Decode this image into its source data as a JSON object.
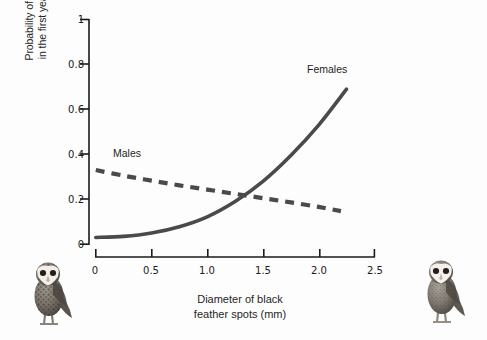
{
  "chart_data": {
    "type": "line",
    "title": "",
    "xlabel": "Diameter of black feather spots (mm)",
    "ylabel": "Probability of survival in the first year of life",
    "xlim": [
      0,
      2.5
    ],
    "ylim": [
      0,
      1
    ],
    "grid": false,
    "legend_position": "inline-annotations",
    "xticks": [
      "0",
      "0.5",
      "1.0",
      "1.5",
      "2.0",
      "2.5"
    ],
    "xtick_values": [
      0,
      0.5,
      1.0,
      1.5,
      2.0,
      2.5
    ],
    "yticks": [
      "0",
      "0.2",
      "0.4",
      "0.6",
      "0.8",
      "1"
    ],
    "ytick_values": [
      0,
      0.2,
      0.4,
      0.6,
      0.8,
      1.0
    ],
    "series": [
      {
        "name": "Males",
        "style": "dashed",
        "color": "#4a4a4a",
        "x": [
          0.0,
          0.25,
          0.5,
          0.75,
          1.0,
          1.25,
          1.5,
          1.75,
          2.0,
          2.2
        ],
        "values": [
          0.33,
          0.305,
          0.283,
          0.262,
          0.243,
          0.224,
          0.205,
          0.186,
          0.166,
          0.147
        ]
      },
      {
        "name": "Females",
        "style": "solid",
        "color": "#4a4a4a",
        "x": [
          0.0,
          0.25,
          0.5,
          0.75,
          1.0,
          1.25,
          1.5,
          1.75,
          2.0,
          2.25
        ],
        "values": [
          0.03,
          0.035,
          0.05,
          0.078,
          0.122,
          0.19,
          0.28,
          0.395,
          0.53,
          0.69
        ]
      }
    ],
    "annotations": [
      {
        "text": "Males",
        "x": 0.16,
        "y": 0.435
      },
      {
        "text": "Females",
        "x": 1.89,
        "y": 0.81
      }
    ],
    "intersection": {
      "x": 1.32,
      "y": 0.215
    }
  },
  "axes": {
    "x_title_line1": "Diameter of black",
    "x_title_line2": "feather spots (mm)",
    "y_title_line1": "Probability of survival",
    "y_title_line2": "in the first year of life"
  },
  "labels": {
    "males": "Males",
    "females": "Females"
  },
  "ticks": {
    "x": [
      "0",
      "0.5",
      "1.0",
      "1.5",
      "2.0",
      "2.5"
    ],
    "y": [
      "1",
      "0.8",
      "0.6",
      "0.4",
      "0.2",
      "0"
    ]
  },
  "illustrations": {
    "left_owl_alt": "barn owl with large black feather spots",
    "right_owl_alt": "barn owl with small black feather spots"
  },
  "colors": {
    "line": "#4a4a4a",
    "axis": "#1a1a1a",
    "text": "#1f1f1f",
    "background": "#fdfdfd"
  }
}
